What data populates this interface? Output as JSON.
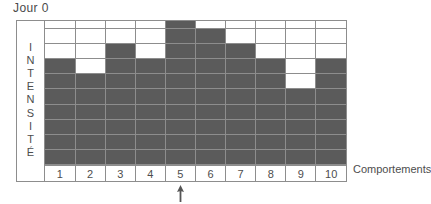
{
  "title": "Jour 0",
  "y_axis": {
    "label": "INTENSITÉ",
    "chars": [
      "I",
      "N",
      "T",
      "E",
      "N",
      "S",
      "I",
      "T",
      "É"
    ]
  },
  "x_axis": {
    "caption": "Comportements",
    "ticks": [
      "1",
      "2",
      "3",
      "4",
      "5",
      "6",
      "7",
      "8",
      "9",
      "10"
    ]
  },
  "annotation": {
    "pointer_icon": "up-arrow-icon",
    "points_to_category": "5"
  },
  "colors": {
    "filled": "#5b5b5b",
    "empty": "#ffffff",
    "grid_line": "#8d8d8d",
    "text": "#4d4d4d"
  },
  "chart_data": {
    "type": "bar",
    "title": "Jour 0",
    "xlabel": "Comportements",
    "ylabel": "INTENSITÉ",
    "categories": [
      "1",
      "2",
      "3",
      "4",
      "5",
      "6",
      "7",
      "8",
      "9",
      "10"
    ],
    "values": [
      7,
      6,
      8,
      7,
      10,
      9,
      8,
      7,
      5,
      7
    ],
    "ylim": [
      0,
      10
    ],
    "rows": 10,
    "grid": true,
    "legend": "none",
    "note": "Filled cells are counted from the bottom of each column; column 9 has an extra gap cell at intensity level 6.",
    "filled_matrix": [
      [
        0,
        0,
        0,
        0,
        1,
        0,
        0,
        0,
        0,
        0
      ],
      [
        0,
        0,
        0,
        0,
        1,
        1,
        0,
        0,
        0,
        0
      ],
      [
        0,
        0,
        1,
        0,
        1,
        1,
        1,
        0,
        0,
        0
      ],
      [
        1,
        0,
        1,
        1,
        1,
        1,
        1,
        1,
        0,
        1
      ],
      [
        1,
        1,
        1,
        1,
        1,
        1,
        1,
        1,
        0,
        1
      ],
      [
        1,
        1,
        1,
        1,
        1,
        1,
        1,
        1,
        1,
        1
      ],
      [
        1,
        1,
        1,
        1,
        1,
        1,
        1,
        1,
        1,
        1
      ],
      [
        1,
        1,
        1,
        1,
        1,
        1,
        1,
        1,
        1,
        1
      ],
      [
        1,
        1,
        1,
        1,
        1,
        1,
        1,
        1,
        1,
        1
      ],
      [
        1,
        1,
        1,
        1,
        1,
        1,
        1,
        1,
        1,
        1
      ]
    ]
  }
}
